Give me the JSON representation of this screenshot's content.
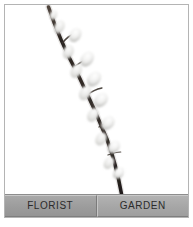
{
  "card": {
    "border_color": "#b4b4b4",
    "background": "#ffffff"
  },
  "photo": {
    "alt_name": "pussy-willow-branch-photo",
    "background": "#ffffff",
    "subject": "pussy willow branch",
    "stem_color": "#2a2320",
    "catkin_color": "#efefee",
    "catkin_shadow": "#b9b9b7"
  },
  "tabs": [
    {
      "id": "florist",
      "label": "FLORIST",
      "background": "#9c9c9c",
      "text_color": "#2b2b2b",
      "selected": true
    },
    {
      "id": "garden",
      "label": "GARDEN",
      "background": "#a6a6a6",
      "text_color": "#2b2b2b",
      "selected": false
    }
  ]
}
